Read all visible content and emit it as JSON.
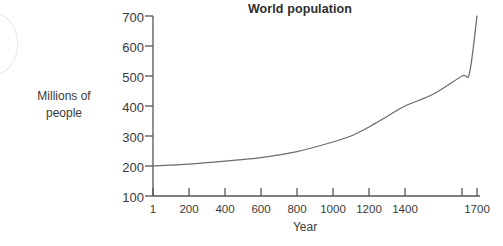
{
  "chart_data": {
    "type": "line",
    "title": "World population",
    "xlabel": "Year",
    "ylabel": "Millions of people",
    "ylabel_lines": [
      "Millions of",
      "people"
    ],
    "grid": false,
    "legend": "none",
    "ylim": [
      100,
      700
    ],
    "ytick_values": [
      100,
      200,
      300,
      400,
      500,
      600,
      700
    ],
    "ytick_labels": [
      "100",
      "200",
      "300",
      "400",
      "500",
      "600",
      "700"
    ],
    "xtick_values": [
      1,
      200,
      400,
      600,
      800,
      1000,
      1200,
      1400,
      1600,
      1700
    ],
    "xtick_labels": [
      "1",
      "200",
      "400",
      "600",
      "800",
      "1000",
      "1200",
      "1400",
      "",
      "1700"
    ],
    "xlim": [
      1,
      1700
    ],
    "x_axis_note": "category-like spacing: equal gaps for 1..1400, compressed gap between 1600 and 1700",
    "series": [
      {
        "name": "World population",
        "color": "#6b6b70",
        "x": [
          1,
          200,
          400,
          600,
          800,
          1000,
          1100,
          1200,
          1300,
          1400,
          1500,
          1600,
          1650,
          1700
        ],
        "values": [
          200,
          206,
          216,
          228,
          248,
          280,
          300,
          330,
          365,
          400,
          440,
          500,
          510,
          700
        ]
      }
    ]
  },
  "decoration": {
    "arc_name": "corner-arc-watermark",
    "arc_color": "#e8e8ea"
  }
}
